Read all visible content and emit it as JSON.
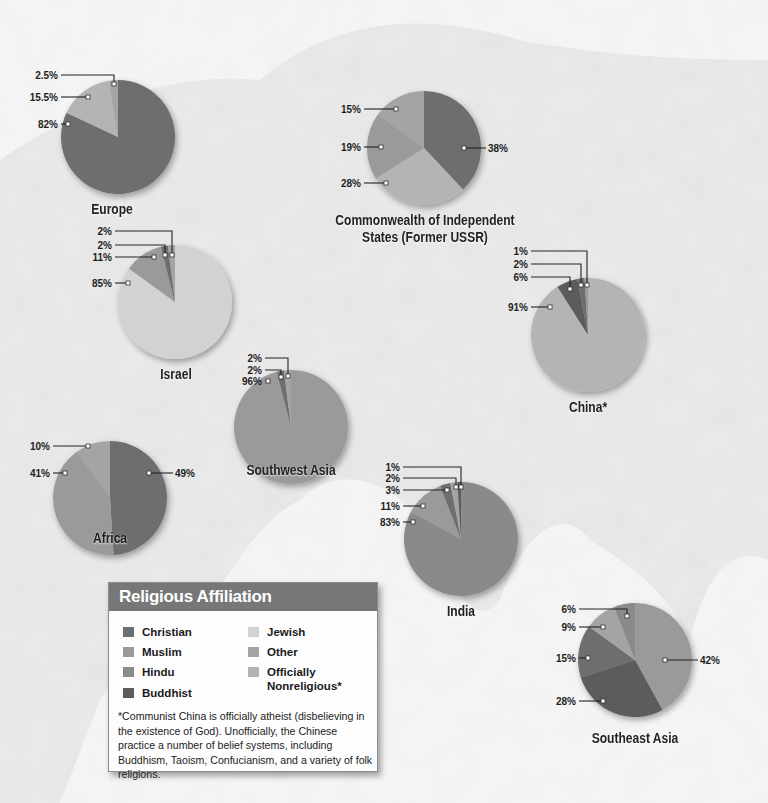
{
  "palette": {
    "christian": "#6e6e6e",
    "muslim": "#9a9a9a",
    "hindu": "#8a8a8a",
    "buddhist": "#5c5c5c",
    "jewish": "#d2d2d2",
    "other": "#a4a4a4",
    "nonreligious": "#b4b4b4"
  },
  "legend": {
    "title": "Religious Affiliation",
    "items": [
      {
        "key": "christian",
        "label": "Christian"
      },
      {
        "key": "muslim",
        "label": "Muslim"
      },
      {
        "key": "hindu",
        "label": "Hindu"
      },
      {
        "key": "buddhist",
        "label": "Buddhist"
      },
      {
        "key": "jewish",
        "label": "Jewish"
      },
      {
        "key": "other",
        "label": "Other"
      },
      {
        "key": "nonreligious",
        "label": "Officially Nonreligious*"
      }
    ],
    "footnote": "*Communist China is officially atheist (disbelieving in the existence of God). Unofficially, the Chinese practice a number of belief systems, including Buddhism, Taoism, Confucianism, and a variety of folk religions."
  },
  "chart_data": [
    {
      "type": "pie",
      "title": "Europe",
      "categories": [
        "Christian",
        "Officially Nonreligious",
        "Other"
      ],
      "values": [
        82,
        15.5,
        2.5
      ],
      "labels": [
        "82%",
        "15.5%",
        "2.5%"
      ]
    },
    {
      "type": "pie",
      "title": "Commonwealth of Independent States (Former USSR)",
      "categories": [
        "Christian",
        "Officially Nonreligious",
        "Muslim",
        "Other"
      ],
      "values": [
        38,
        28,
        19,
        15
      ],
      "labels": [
        "38%",
        "28%",
        "19%",
        "15%"
      ]
    },
    {
      "type": "pie",
      "title": "Israel",
      "categories": [
        "Jewish",
        "Muslim",
        "Christian",
        "Other"
      ],
      "values": [
        85,
        11,
        2,
        2
      ],
      "labels": [
        "85%",
        "11%",
        "2%",
        "2%"
      ]
    },
    {
      "type": "pie",
      "title": "China*",
      "categories": [
        "Officially Nonreligious",
        "Buddhist",
        "Christian",
        "Muslim"
      ],
      "values": [
        91,
        6,
        2,
        1
      ],
      "labels": [
        "91%",
        "6%",
        "2%",
        "1%"
      ]
    },
    {
      "type": "pie",
      "title": "Southwest Asia",
      "categories": [
        "Muslim",
        "Christian",
        "Other"
      ],
      "values": [
        96,
        2,
        2
      ],
      "labels": [
        "96%",
        "2%",
        "2%"
      ]
    },
    {
      "type": "pie",
      "title": "Africa",
      "categories": [
        "Christian",
        "Muslim",
        "Other"
      ],
      "values": [
        49,
        41,
        10
      ],
      "labels": [
        "49%",
        "41%",
        "10%"
      ]
    },
    {
      "type": "pie",
      "title": "India",
      "categories": [
        "Hindu",
        "Muslim",
        "Christian",
        "Other",
        "Buddhist"
      ],
      "values": [
        83,
        11,
        3,
        2,
        1
      ],
      "labels": [
        "83%",
        "11%",
        "3%",
        "2%",
        "1%"
      ]
    },
    {
      "type": "pie",
      "title": "Southeast Asia",
      "categories": [
        "Muslim",
        "Buddhist",
        "Christian",
        "Other",
        "Hindu"
      ],
      "values": [
        42,
        28,
        15,
        9,
        6
      ],
      "labels": [
        "42%",
        "28%",
        "15%",
        "9%",
        "6%"
      ]
    }
  ],
  "layout_pies": [
    {
      "cx": 118,
      "cy": 137,
      "r": 57,
      "keys": [
        "christian",
        "nonreligious",
        "other"
      ],
      "title_x": 112,
      "title_y": 201,
      "title_lines": [
        "Europe"
      ],
      "callouts": [
        {
          "i": 0,
          "side": "left",
          "lx": 58,
          "ly": 124,
          "px": 68,
          "py": 124
        },
        {
          "i": 1,
          "side": "left",
          "lx": 58,
          "ly": 97,
          "px": 88,
          "py": 97
        },
        {
          "i": 2,
          "side": "left-elbow",
          "lx": 58,
          "ly": 75,
          "px": 114,
          "py": 84
        }
      ]
    },
    {
      "cx": 424,
      "cy": 148,
      "r": 57,
      "keys": [
        "christian",
        "nonreligious",
        "muslim",
        "other"
      ],
      "title_x": 425,
      "title_y": 212,
      "title_lines": [
        "Commonwealth of Independent",
        "States (Former USSR)"
      ],
      "callouts": [
        {
          "i": 0,
          "side": "right",
          "lx": 488,
          "ly": 148,
          "px": 464,
          "py": 148
        },
        {
          "i": 1,
          "side": "left",
          "lx": 361,
          "ly": 183,
          "px": 386,
          "py": 183
        },
        {
          "i": 2,
          "side": "left",
          "lx": 361,
          "ly": 147,
          "px": 381,
          "py": 147
        },
        {
          "i": 3,
          "side": "left",
          "lx": 361,
          "ly": 109,
          "px": 396,
          "py": 109
        }
      ]
    },
    {
      "cx": 175,
      "cy": 302,
      "r": 57,
      "keys": [
        "jewish",
        "muslim",
        "christian",
        "other"
      ],
      "title_x": 176,
      "title_y": 366,
      "title_lines": [
        "Israel"
      ],
      "callouts": [
        {
          "i": 0,
          "side": "left",
          "lx": 112,
          "ly": 283,
          "px": 128,
          "py": 283
        },
        {
          "i": 1,
          "side": "left",
          "lx": 112,
          "ly": 257,
          "px": 154,
          "py": 257
        },
        {
          "i": 2,
          "side": "left-elbow",
          "lx": 112,
          "ly": 245,
          "px": 165,
          "py": 255
        },
        {
          "i": 3,
          "side": "left-elbow",
          "lx": 112,
          "ly": 231,
          "px": 172,
          "py": 255
        }
      ]
    },
    {
      "cx": 588,
      "cy": 335,
      "r": 57,
      "keys": [
        "nonreligious",
        "buddhist",
        "christian",
        "muslim"
      ],
      "title_x": 588,
      "title_y": 399,
      "title_lines": [
        "China*"
      ],
      "callouts": [
        {
          "i": 0,
          "side": "left",
          "lx": 528,
          "ly": 307,
          "px": 550,
          "py": 307
        },
        {
          "i": 1,
          "side": "left-elbow",
          "lx": 528,
          "ly": 277,
          "px": 570,
          "py": 289
        },
        {
          "i": 2,
          "side": "left-elbow",
          "lx": 528,
          "ly": 264,
          "px": 581,
          "py": 285
        },
        {
          "i": 3,
          "side": "left-elbow",
          "lx": 528,
          "ly": 251,
          "px": 587,
          "py": 285
        }
      ]
    },
    {
      "cx": 291,
      "cy": 427,
      "r": 57,
      "keys": [
        "muslim",
        "christian",
        "other"
      ],
      "title_x": 291,
      "title_y": 462,
      "title_lines": [
        "Southwest Asia"
      ],
      "callouts": [
        {
          "i": 0,
          "side": "left",
          "lx": 262,
          "ly": 381,
          "px": 268,
          "py": 381
        },
        {
          "i": 1,
          "side": "left-elbow",
          "lx": 262,
          "ly": 370,
          "px": 281,
          "py": 377
        },
        {
          "i": 2,
          "side": "left-elbow",
          "lx": 262,
          "ly": 358,
          "px": 288,
          "py": 376
        }
      ]
    },
    {
      "cx": 110,
      "cy": 498,
      "r": 57,
      "keys": [
        "christian",
        "muslim",
        "other"
      ],
      "title_x": 110,
      "title_y": 530,
      "title_lines": [
        "Africa"
      ],
      "callouts": [
        {
          "i": 0,
          "side": "right",
          "lx": 175,
          "ly": 473,
          "px": 149,
          "py": 473
        },
        {
          "i": 1,
          "side": "left",
          "lx": 50,
          "ly": 473,
          "px": 65,
          "py": 473
        },
        {
          "i": 2,
          "side": "left",
          "lx": 50,
          "ly": 446,
          "px": 88,
          "py": 446
        }
      ]
    },
    {
      "cx": 461,
      "cy": 539,
      "r": 57,
      "keys": [
        "hindu",
        "muslim",
        "christian",
        "other",
        "buddhist"
      ],
      "title_x": 461,
      "title_y": 603,
      "title_lines": [
        "India"
      ],
      "callouts": [
        {
          "i": 0,
          "side": "left",
          "lx": 400,
          "ly": 522,
          "px": 413,
          "py": 522
        },
        {
          "i": 1,
          "side": "left",
          "lx": 400,
          "ly": 506,
          "px": 423,
          "py": 506
        },
        {
          "i": 2,
          "side": "left-elbow",
          "lx": 400,
          "ly": 490,
          "px": 447,
          "py": 490
        },
        {
          "i": 3,
          "side": "left-elbow",
          "lx": 400,
          "ly": 478,
          "px": 456,
          "py": 487
        },
        {
          "i": 4,
          "side": "left-elbow",
          "lx": 400,
          "ly": 467,
          "px": 461,
          "py": 487
        }
      ]
    },
    {
      "cx": 635,
      "cy": 660,
      "r": 57,
      "keys": [
        "muslim",
        "buddhist",
        "christian",
        "other",
        "hindu"
      ],
      "title_x": 635,
      "title_y": 730,
      "title_lines": [
        "Southeast Asia"
      ],
      "callouts": [
        {
          "i": 0,
          "side": "right",
          "lx": 700,
          "ly": 660,
          "px": 665,
          "py": 660
        },
        {
          "i": 1,
          "side": "left",
          "lx": 576,
          "ly": 701,
          "px": 603,
          "py": 701
        },
        {
          "i": 2,
          "side": "left",
          "lx": 576,
          "ly": 658,
          "px": 588,
          "py": 658
        },
        {
          "i": 3,
          "side": "left",
          "lx": 576,
          "ly": 627,
          "px": 603,
          "py": 627
        },
        {
          "i": 4,
          "side": "left-elbow",
          "lx": 576,
          "ly": 609,
          "px": 627,
          "py": 616
        }
      ]
    }
  ]
}
